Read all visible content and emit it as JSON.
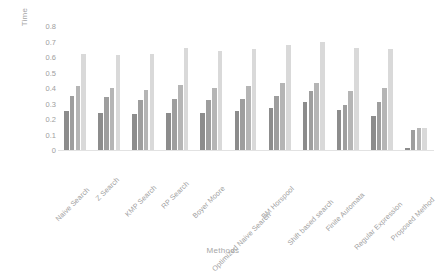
{
  "chart_data": {
    "type": "bar",
    "title": "",
    "xlabel": "Methods",
    "ylabel": "Time",
    "ylim": [
      0,
      0.8
    ],
    "ytick_step": 0.1,
    "yticks": [
      "0.8",
      "0.7",
      "0.6",
      "0.5",
      "0.4",
      "0.3",
      "0.2",
      "0.1",
      "0"
    ],
    "grid": false,
    "legend": "none",
    "orientation": "vertical",
    "grouped": true,
    "categories": [
      "Naive Search",
      "Z Search",
      "KMP Search",
      "RP Search",
      "Boyer Moore",
      "Optimized Naive Search",
      "BM Horspool",
      "Shift based search",
      "Finite Automata",
      "Regular Expression",
      "Proposed Method"
    ],
    "series": [
      {
        "name": "Series 1",
        "color": "#8c8c8c",
        "values": [
          0.25,
          0.24,
          0.23,
          0.24,
          0.24,
          0.25,
          0.27,
          0.31,
          0.26,
          0.22,
          0.01
        ]
      },
      {
        "name": "Series 2",
        "color": "#9e9e9e",
        "values": [
          0.35,
          0.34,
          0.32,
          0.33,
          0.32,
          0.33,
          0.35,
          0.38,
          0.29,
          0.31,
          0.13
        ]
      },
      {
        "name": "Series 3",
        "color": "#b5b5b5",
        "values": [
          0.41,
          0.4,
          0.39,
          0.42,
          0.4,
          0.41,
          0.43,
          0.43,
          0.38,
          0.4,
          0.14
        ]
      },
      {
        "name": "Series 4",
        "color": "#d9d9d9",
        "values": [
          0.62,
          0.61,
          0.62,
          0.66,
          0.64,
          0.65,
          0.68,
          0.7,
          0.66,
          0.65,
          0.14
        ]
      }
    ]
  }
}
